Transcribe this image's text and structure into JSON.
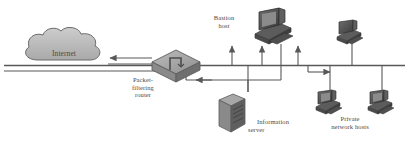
{
  "diagram": {
    "colors": {
      "line": "#585858",
      "fill_light": "#b9b9b9",
      "fill_mid": "#8d8d8d",
      "fill_dark": "#4a4a4a",
      "text": "#4a4a4a",
      "background": "#ffffff"
    },
    "nodes": [
      {
        "id": "internet",
        "icon": "cloud-icon",
        "label": "Internet",
        "label_lines": [
          "Internet"
        ]
      },
      {
        "id": "router",
        "icon": "router-icon",
        "label": "Packet-filtering router",
        "label_lines": [
          "Packet-",
          "filtering",
          "router"
        ]
      },
      {
        "id": "bastion-host",
        "icon": "computer-icon",
        "label": "Bastion host",
        "label_lines": [
          "Bastion",
          "host"
        ]
      },
      {
        "id": "info-server",
        "icon": "server-tower-icon",
        "label": "Information server",
        "label_lines": [
          "Information",
          "server"
        ]
      },
      {
        "id": "private-hosts",
        "icon": "computer-icon",
        "label": "Private network hosts",
        "label_lines": [
          "Private",
          "network hosts"
        ]
      }
    ],
    "links": [
      {
        "from": "router",
        "to": "internet",
        "arrow": "to",
        "direction": "left"
      },
      {
        "from": "backbone",
        "to": "bastion-host",
        "arrow": "to",
        "direction": "up"
      },
      {
        "from": "backbone",
        "to": "info-server",
        "arrow": "to",
        "direction": "left"
      },
      {
        "from": "backbone",
        "to": "private-hosts",
        "arrow": "to",
        "direction": "right"
      }
    ]
  }
}
